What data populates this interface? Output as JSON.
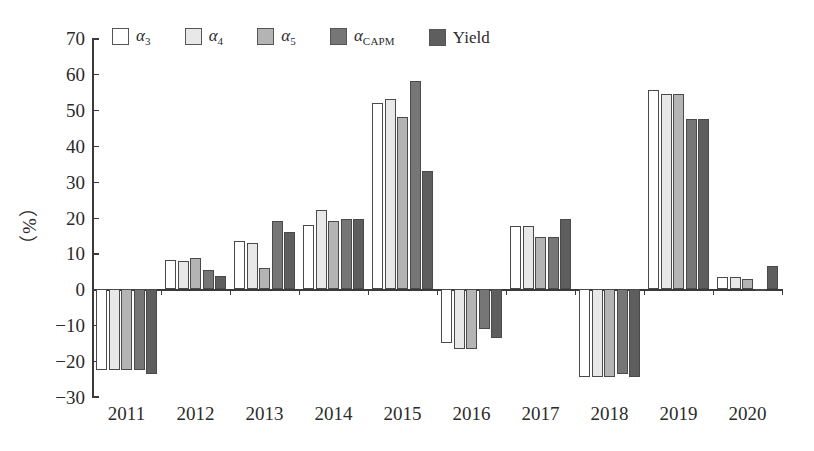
{
  "chart_data": {
    "type": "bar",
    "title": "",
    "xlabel": "",
    "ylabel": "（%）",
    "ylim": [
      -30,
      70
    ],
    "ytick_step": 10,
    "yticks": [
      70,
      60,
      50,
      40,
      30,
      20,
      10,
      0,
      -10,
      -20,
      -30
    ],
    "grid": false,
    "legend_position": "top",
    "categories": [
      "2011",
      "2012",
      "2013",
      "2014",
      "2015",
      "2016",
      "2017",
      "2018",
      "2019",
      "2020"
    ],
    "series": [
      {
        "name": "alpha3",
        "label": "α",
        "sub": "3",
        "color": "#ffffff",
        "values": [
          -22.5,
          8.2,
          13.5,
          18.0,
          52.0,
          -15.0,
          17.5,
          -24.5,
          55.5,
          3.5
        ]
      },
      {
        "name": "alpha4",
        "label": "α",
        "sub": "4",
        "color": "#e8e8e8",
        "values": [
          -22.5,
          7.8,
          13.0,
          22.0,
          53.0,
          -16.5,
          17.5,
          -24.5,
          54.5,
          3.5
        ]
      },
      {
        "name": "alpha5",
        "label": "α",
        "sub": "5",
        "color": "#b4b4b4",
        "values": [
          -22.5,
          8.8,
          6.0,
          19.0,
          48.0,
          -16.5,
          14.5,
          -24.5,
          54.5,
          3.0
        ]
      },
      {
        "name": "alphaCAPM",
        "label": "α",
        "sub": "CAPM",
        "color": "#767676",
        "values": [
          -22.5,
          5.5,
          19.0,
          19.5,
          58.0,
          -11.0,
          14.5,
          -23.5,
          47.5,
          -0.5
        ]
      },
      {
        "name": "yield",
        "label": "Yield",
        "sub": "",
        "color": "#5e5e5e",
        "values": [
          -23.5,
          3.8,
          16.0,
          19.5,
          33.0,
          -13.5,
          19.5,
          -24.5,
          47.5,
          6.5
        ]
      }
    ],
    "legend_entries": [
      "α3",
      "α4",
      "α5",
      "αCAPM",
      "Yield"
    ]
  }
}
